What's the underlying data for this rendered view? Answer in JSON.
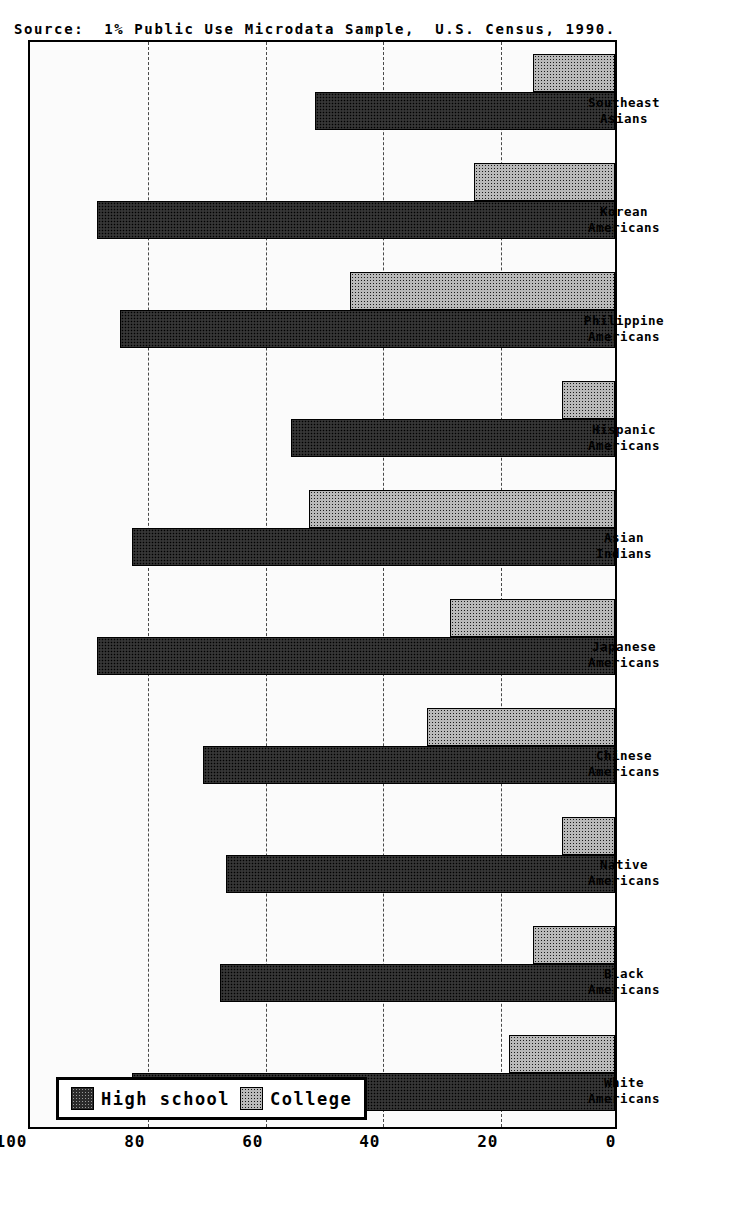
{
  "chart_data": {
    "type": "bar",
    "orientation": "vertical-printed-rotated",
    "title": "",
    "xlabel": "",
    "ylabel": "",
    "ylim": [
      0,
      100
    ],
    "yticks": [
      "100",
      "80",
      "60",
      "40",
      "20",
      "0"
    ],
    "ytick_values": [
      100,
      80,
      60,
      40,
      20,
      0
    ],
    "grid": true,
    "legend_position": "upper-left-inside",
    "categories": [
      "White\nAmericans",
      "Black\nAmericans",
      "Native\nAmericans",
      "Chinese\nAmericans",
      "Japanese\nAmericans",
      "Asian\nIndians",
      "Hispanic\nAmericans",
      "Philippine\nAmericans",
      "Korean\nAmericans",
      "Southeast\nAsians"
    ],
    "series": [
      {
        "name": "High school",
        "color": "#2b2b2b",
        "values": [
          82,
          67,
          66,
          70,
          88,
          82,
          55,
          84,
          88,
          51
        ]
      },
      {
        "name": "College",
        "color": "#b9b9b9",
        "values": [
          18,
          14,
          9,
          32,
          28,
          52,
          9,
          45,
          24,
          14
        ]
      }
    ]
  },
  "legend": {
    "entries": [
      {
        "label": "High school",
        "swatch": "dark-dotted-swatch"
      },
      {
        "label": "College",
        "swatch": "light-dotted-swatch"
      }
    ]
  },
  "caption": {
    "source_text": "Source:  1% Public Use Microdata Sample,  U.S. Census, 1990."
  },
  "colors": {
    "high_school": "#2b2b2b",
    "college": "#b9b9b9",
    "plot_background": "#fbfbfb",
    "frame": "#000000"
  }
}
